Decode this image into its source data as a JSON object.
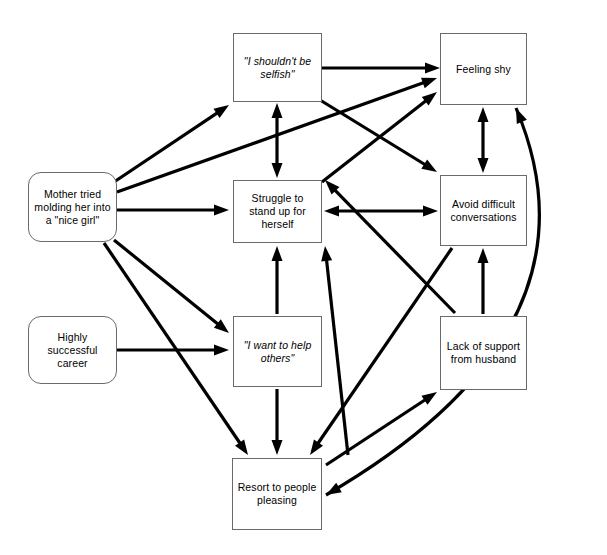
{
  "diagram": {
    "background_color": "#ffffff",
    "line_color": "#000000",
    "box_border_color": "#6a6a6a",
    "nodes": [
      {
        "id": "should-not-be-selfish",
        "label": "\"I shouldn't be selfish\"",
        "shape": "rectangle",
        "style": "italic",
        "x": 233,
        "y": 33,
        "w": 89,
        "h": 69
      },
      {
        "id": "feeling-shy",
        "label": "Feeling shy",
        "shape": "rectangle",
        "style": "normal",
        "x": 440,
        "y": 33,
        "w": 87,
        "h": 72
      },
      {
        "id": "mother-nice-girl",
        "label": "Mother tried molding her into a \"nice girl\"",
        "shape": "rounded",
        "style": "normal",
        "x": 28,
        "y": 172,
        "w": 89,
        "h": 70
      },
      {
        "id": "struggle-stand-up",
        "label": "Struggle to stand up for herself",
        "shape": "rectangle",
        "style": "normal",
        "x": 233,
        "y": 180,
        "w": 89,
        "h": 63
      },
      {
        "id": "avoid-difficult-conversations",
        "label": "Avoid difficult conversations",
        "shape": "rectangle",
        "style": "normal",
        "x": 440,
        "y": 175,
        "w": 87,
        "h": 71
      },
      {
        "id": "highly-successful-career",
        "label": "Highly successful career",
        "shape": "rounded",
        "style": "normal",
        "x": 28,
        "y": 316,
        "w": 89,
        "h": 68
      },
      {
        "id": "want-to-help-others",
        "label": "\"I want to help others\"",
        "shape": "rectangle",
        "style": "italic",
        "x": 233,
        "y": 316,
        "w": 89,
        "h": 71
      },
      {
        "id": "lack-of-support-husband",
        "label": "Lack of support from husband",
        "shape": "rectangle",
        "style": "normal",
        "x": 440,
        "y": 316,
        "w": 87,
        "h": 74
      },
      {
        "id": "resort-to-people-pleasing",
        "label": "Resort to people pleasing",
        "shape": "rectangle",
        "style": "normal",
        "x": 232,
        "y": 458,
        "w": 90,
        "h": 72
      }
    ],
    "edges": [
      {
        "from": "should-not-be-selfish",
        "to": "feeling-shy",
        "kind": "straight",
        "direction": "one-way",
        "x1": 322,
        "y1": 68,
        "x2": 440,
        "y2": 68
      },
      {
        "from": "mother-nice-girl",
        "to": "should-not-be-selfish",
        "kind": "straight",
        "direction": "one-way",
        "x1": 114,
        "y1": 182,
        "x2": 229,
        "y2": 105
      },
      {
        "from": "mother-nice-girl",
        "to": "feeling-shy",
        "kind": "straight",
        "direction": "one-way",
        "x1": 117,
        "y1": 192,
        "x2": 437,
        "y2": 78
      },
      {
        "from": "mother-nice-girl",
        "to": "struggle-stand-up",
        "kind": "straight",
        "direction": "one-way",
        "x1": 117,
        "y1": 210,
        "x2": 229,
        "y2": 210
      },
      {
        "from": "mother-nice-girl",
        "to": "want-to-help-others",
        "kind": "straight",
        "direction": "one-way",
        "x1": 114,
        "y1": 240,
        "x2": 229,
        "y2": 333
      },
      {
        "from": "mother-nice-girl",
        "to": "resort-to-people-pleasing",
        "kind": "straight",
        "direction": "one-way",
        "x1": 104,
        "y1": 243,
        "x2": 248,
        "y2": 455
      },
      {
        "from": "should-not-be-selfish",
        "to": "struggle-stand-up",
        "kind": "straight",
        "direction": "both",
        "x1": 277,
        "y1": 103,
        "x2": 277,
        "y2": 178
      },
      {
        "from": "should-not-be-selfish",
        "to": "avoid-difficult-conversations",
        "kind": "straight",
        "direction": "one-way",
        "x1": 320,
        "y1": 100,
        "x2": 437,
        "y2": 172
      },
      {
        "from": "lack-of-support-husband",
        "to": "struggle-stand-up",
        "kind": "straight",
        "direction": "one-way",
        "x1": 455,
        "y1": 313,
        "x2": 325,
        "y2": 180
      },
      {
        "from": "struggle-stand-up",
        "to": "feeling-shy",
        "kind": "straight",
        "direction": "one-way",
        "x1": 322,
        "y1": 182,
        "x2": 437,
        "y2": 92
      },
      {
        "from": "struggle-stand-up",
        "to": "avoid-difficult-conversations",
        "kind": "straight",
        "direction": "both",
        "x1": 324,
        "y1": 211,
        "x2": 438,
        "y2": 211
      },
      {
        "from": "feeling-shy",
        "to": "avoid-difficult-conversations",
        "kind": "straight",
        "direction": "both",
        "x1": 483,
        "y1": 107,
        "x2": 483,
        "y2": 173
      },
      {
        "from": "lack-of-support-husband",
        "to": "avoid-difficult-conversations",
        "kind": "straight",
        "direction": "one-way",
        "x1": 483,
        "y1": 314,
        "x2": 483,
        "y2": 248
      },
      {
        "from": "highly-successful-career",
        "to": "want-to-help-others",
        "kind": "straight",
        "direction": "one-way",
        "x1": 117,
        "y1": 350,
        "x2": 229,
        "y2": 350
      },
      {
        "from": "want-to-help-others",
        "to": "struggle-stand-up",
        "kind": "straight",
        "direction": "one-way",
        "x1": 277,
        "y1": 314,
        "x2": 277,
        "y2": 246
      },
      {
        "from": "want-to-help-others",
        "to": "resort-to-people-pleasing",
        "kind": "straight",
        "direction": "one-way",
        "x1": 277,
        "y1": 389,
        "x2": 277,
        "y2": 455
      },
      {
        "from": "avoid-difficult-conversations",
        "to": "resort-to-people-pleasing",
        "kind": "straight",
        "direction": "one-way",
        "x1": 452,
        "y1": 248,
        "x2": 310,
        "y2": 455
      },
      {
        "from": "resort-to-people-pleasing",
        "to": "struggle-stand-up",
        "kind": "straight",
        "direction": "one-way",
        "x1": 348,
        "y1": 455,
        "x2": 325,
        "y2": 246
      },
      {
        "from": "resort-to-people-pleasing",
        "to": "lack-of-support-husband",
        "kind": "straight",
        "direction": "one-way",
        "x1": 326,
        "y1": 465,
        "x2": 437,
        "y2": 392
      },
      {
        "from": "feeling-shy",
        "to": "resort-to-people-pleasing",
        "kind": "curved",
        "direction": "both",
        "x1": 516,
        "y1": 108,
        "cx": 610,
        "cy": 330,
        "x2": 326,
        "y2": 495
      }
    ]
  }
}
